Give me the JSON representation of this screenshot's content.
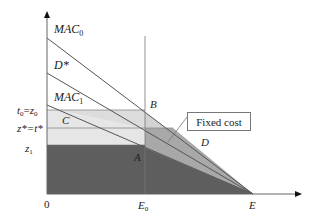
{
  "diagram": {
    "curves": {
      "mac0": {
        "label": "MAC",
        "sub": "0"
      },
      "dstar": {
        "label": "D*"
      },
      "mac1": {
        "label": "MAC",
        "sub": "1"
      }
    },
    "y_labels": {
      "t0z0": {
        "a": "t",
        "a_sub": "0",
        "eq": "=",
        "b": "z",
        "b_sub": "0"
      },
      "zstar": {
        "text": "z*=t*"
      },
      "z1": {
        "a": "z",
        "a_sub": "1"
      }
    },
    "x_labels": {
      "origin": "0",
      "e0": {
        "a": "E",
        "a_sub": "0"
      },
      "e": "E"
    },
    "points": {
      "A": "A",
      "B": "B",
      "C": "C",
      "D": "D"
    },
    "callout": {
      "fixed_cost": "Fixed cost"
    },
    "colors": {
      "dark_region": "#5a5a5a",
      "mid_region": "#a8a8a8",
      "light_region": "#d6d6d6",
      "lighter_region": "#e8e8e8",
      "line": "#555555"
    }
  }
}
